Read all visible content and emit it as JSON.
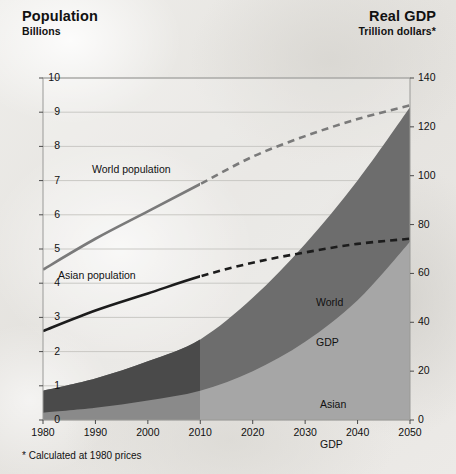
{
  "header": {
    "left_title": "Population",
    "left_subtitle": "Billions",
    "right_title": "Real GDP",
    "right_subtitle": "Trillion dollars*"
  },
  "footnote": "* Calculated at 1980 prices",
  "labels": {
    "world_population": "World population",
    "asian_population": "Asian population",
    "world_gdp_line1": "World",
    "world_gdp_line2": "GDP",
    "asian_gdp_line1": "Asian",
    "asian_gdp_line2": "GDP"
  },
  "colors": {
    "world_gdp_fill": "#6d6d6d",
    "asian_gdp_fill": "#a6a6a6",
    "world_gdp_fill_history": "#4a4a4a",
    "asian_gdp_fill_history": "#8c8c8c",
    "world_population_line": "#7a7a7a",
    "asian_population_line": "#1c1c1c",
    "gridline": "#c9c8c4",
    "axis": "#6a6a68",
    "text": "#111111",
    "background": "#ebeae7"
  },
  "chart_data": {
    "type": "area",
    "subtitle": "",
    "xlabel": "",
    "ylabel": "Billions",
    "y2label": "Trillion dollars",
    "grid": true,
    "legend": "inline-annotations",
    "projection_starts": 2010,
    "x": [
      1980,
      1990,
      2000,
      2010,
      2020,
      2030,
      2040,
      2050
    ],
    "xlim": [
      1980,
      2050
    ],
    "xticks": [
      "1980",
      "1990",
      "2000",
      "2010",
      "2020",
      "2030",
      "2040",
      "2050"
    ],
    "ylim_left": [
      0,
      10
    ],
    "yticks_left": [
      "0",
      "1",
      "2",
      "3",
      "4",
      "5",
      "6",
      "7",
      "8",
      "9",
      "10"
    ],
    "ylim_right": [
      0,
      140
    ],
    "yticks_right": [
      "0",
      "20",
      "40",
      "60",
      "80",
      "100",
      "120",
      "140"
    ],
    "series": [
      {
        "name": "World population",
        "axis": "left",
        "unit": "billions",
        "style": "line-solid-then-dashed",
        "color": "#7a7a7a",
        "values": [
          4.4,
          5.3,
          6.1,
          6.9,
          7.7,
          8.3,
          8.8,
          9.2
        ]
      },
      {
        "name": "Asian population",
        "axis": "left",
        "unit": "billions",
        "style": "line-solid-then-dashed",
        "color": "#1c1c1c",
        "values": [
          2.6,
          3.2,
          3.7,
          4.2,
          4.6,
          4.9,
          5.15,
          5.3
        ]
      },
      {
        "name": "World GDP",
        "axis": "right",
        "unit": "trillion dollars (1980 prices)",
        "style": "area",
        "color": "#6d6d6d",
        "values": [
          12,
          17,
          24,
          33,
          50,
          72,
          98,
          128
        ]
      },
      {
        "name": "Asian GDP",
        "axis": "right",
        "unit": "trillion dollars (1980 prices)",
        "style": "area",
        "color": "#a6a6a6",
        "values": [
          3,
          5,
          8,
          12,
          20,
          32,
          49,
          73
        ]
      }
    ]
  }
}
